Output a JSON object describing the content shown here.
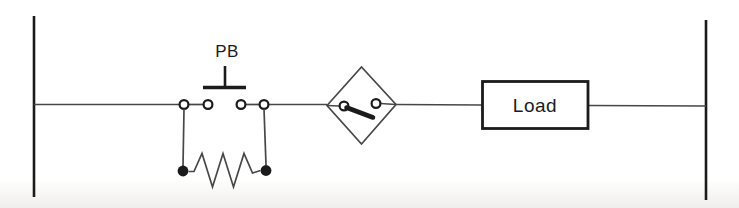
{
  "diagram": {
    "kind": "ladder-circuit-diagram",
    "labels": {
      "pushbutton": "PB",
      "load": "Load"
    },
    "symbols": [
      {
        "name": "left-power-rail"
      },
      {
        "name": "pushbutton-no-contact",
        "label": "PB"
      },
      {
        "name": "parallel-resistor-branch"
      },
      {
        "name": "switch-in-diamond"
      },
      {
        "name": "load-box",
        "label": "Load"
      },
      {
        "name": "right-power-rail"
      }
    ],
    "colors": {
      "line": "#474747",
      "dark": "#1b1b1b",
      "background": "#ffffff",
      "shade": "#efeeec"
    }
  }
}
